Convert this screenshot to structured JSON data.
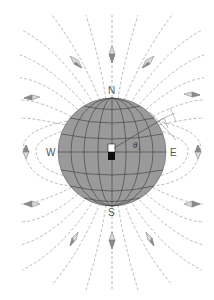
{
  "figure": {
    "labels": {
      "north": "N",
      "south": "S",
      "east": "E",
      "west": "W",
      "angle": "θ₁"
    },
    "colors": {
      "sphere": "#9a9a9a",
      "grid": "#3a3a3a",
      "field_lines": "#a8a8a8",
      "compass": "#8a8a8a",
      "magnet_north": "#ffffff",
      "magnet_south": "#111111"
    },
    "sphere": {
      "cx": 112,
      "cy": 152,
      "r": 54
    }
  }
}
